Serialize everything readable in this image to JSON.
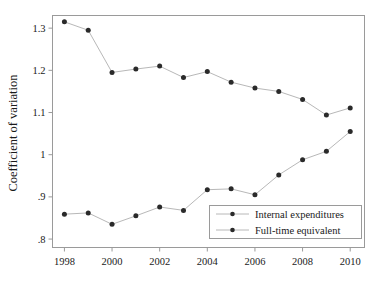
{
  "chart_data": {
    "type": "line",
    "title": "",
    "subtitle": "",
    "xlabel": "",
    "ylabel": "Coefficient of variation",
    "x": [
      1998,
      1999,
      2000,
      2001,
      2002,
      2003,
      2004,
      2005,
      2006,
      2007,
      2008,
      2009,
      2010
    ],
    "xtick_labels": [
      "1998",
      "2000",
      "2002",
      "2004",
      "2006",
      "2008",
      "2010"
    ],
    "xtick_values": [
      1998,
      2000,
      2002,
      2004,
      2006,
      2008,
      2010
    ],
    "ytick_labels": [
      "1.3",
      "1.2",
      "1.1",
      "1",
      ".9",
      ".8"
    ],
    "ytick_values": [
      1.3,
      1.2,
      1.1,
      1.0,
      0.9,
      0.8
    ],
    "xlim": [
      1997.5,
      2010.6
    ],
    "ylim": [
      0.78,
      1.33
    ],
    "grid": false,
    "legend_position": "lower-right-inside",
    "series": [
      {
        "name": "Internal expenditures",
        "marker": "circle",
        "values": [
          1.315,
          1.295,
          1.195,
          1.203,
          1.21,
          1.183,
          1.197,
          1.172,
          1.158,
          1.15,
          1.131,
          1.094,
          1.111
        ]
      },
      {
        "name": "Full-time equivalent",
        "marker": "circle",
        "values": [
          0.859,
          0.862,
          0.835,
          0.855,
          0.876,
          0.868,
          0.917,
          0.919,
          0.905,
          0.952,
          0.988,
          1.008,
          1.055
        ]
      }
    ],
    "colors": {
      "line": "#b8b8b8",
      "marker": "#2a2a2a",
      "frame": "#9a9a9a",
      "text": "#1a1a1a",
      "background": "#ffffff"
    }
  },
  "legend": {
    "entries": [
      {
        "label": "Internal expenditures"
      },
      {
        "label": "Full-time equivalent"
      }
    ]
  },
  "axes": {
    "y_title": "Coefficient of variation"
  }
}
